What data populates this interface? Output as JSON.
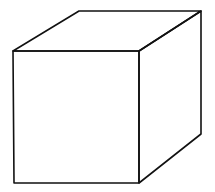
{
  "figure": {
    "stroke_color": "#111111",
    "background": "#ffffff",
    "vertices": {
      "front_top_left": [
        13,
        51
      ],
      "front_top_right": [
        139,
        51
      ],
      "front_bottom_left": [
        14,
        183
      ],
      "front_bottom_right": [
        139,
        183
      ],
      "back_top_left": [
        79,
        11
      ],
      "back_top_right": [
        201,
        11
      ],
      "back_bottom_right": [
        201,
        134
      ]
    }
  }
}
